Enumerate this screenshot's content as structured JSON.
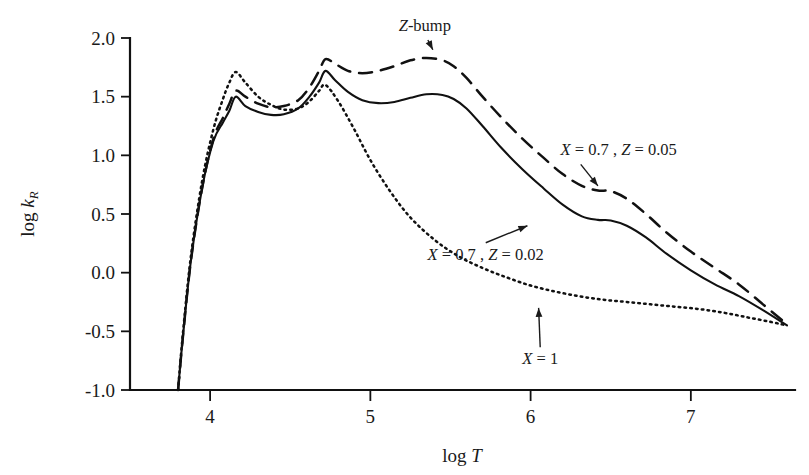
{
  "chart_data": {
    "type": "line",
    "title": "",
    "xlabel": "log T",
    "ylabel": "log k_R",
    "xlabel_parts": {
      "prefix": "log ",
      "symbol": "T"
    },
    "ylabel_parts": {
      "prefix": "log ",
      "symbol": "k",
      "subscript": "R"
    },
    "xlim": [
      3.5,
      7.65
    ],
    "ylim": [
      -1.0,
      2.0
    ],
    "xticks": [
      4,
      5,
      6,
      7
    ],
    "xtick_labels": [
      "4",
      "5",
      "6",
      "7"
    ],
    "yticks": [
      -1.0,
      -0.5,
      0.0,
      0.5,
      1.0,
      1.5,
      2.0
    ],
    "ytick_labels": [
      "-1.0",
      "-0.5",
      "0.0",
      "0.5",
      "1.0",
      "1.5",
      "2.0"
    ],
    "grid": false,
    "legend_position": "inline-annotations",
    "series": [
      {
        "name": "X = 0.7 , Z = 0.02",
        "style": "solid",
        "color": "#111111",
        "x": [
          3.8,
          3.83,
          3.88,
          3.95,
          4.02,
          4.08,
          4.12,
          4.16,
          4.22,
          4.3,
          4.38,
          4.46,
          4.55,
          4.62,
          4.68,
          4.72,
          4.78,
          4.86,
          4.95,
          5.05,
          5.15,
          5.25,
          5.35,
          5.45,
          5.52,
          5.6,
          5.7,
          5.82,
          5.95,
          6.08,
          6.2,
          6.32,
          6.42,
          6.5,
          6.6,
          6.72,
          6.85,
          7.0,
          7.15,
          7.3,
          7.45,
          7.6
        ],
        "y": [
          -1.0,
          -0.55,
          0.1,
          0.72,
          1.12,
          1.28,
          1.38,
          1.5,
          1.42,
          1.37,
          1.345,
          1.35,
          1.4,
          1.5,
          1.62,
          1.72,
          1.64,
          1.54,
          1.47,
          1.445,
          1.455,
          1.49,
          1.52,
          1.515,
          1.48,
          1.4,
          1.25,
          1.06,
          0.88,
          0.72,
          0.58,
          0.48,
          0.45,
          0.445,
          0.4,
          0.3,
          0.16,
          0.02,
          -0.1,
          -0.2,
          -0.32,
          -0.45
        ]
      },
      {
        "name": "X = 0.7 , Z = 0.05",
        "style": "dashed",
        "color": "#111111",
        "x": [
          3.8,
          3.83,
          3.88,
          3.95,
          4.02,
          4.08,
          4.12,
          4.16,
          4.22,
          4.3,
          4.38,
          4.46,
          4.55,
          4.62,
          4.68,
          4.72,
          4.78,
          4.86,
          4.95,
          5.05,
          5.15,
          5.25,
          5.35,
          5.45,
          5.52,
          5.6,
          5.7,
          5.82,
          5.95,
          6.08,
          6.2,
          6.32,
          6.42,
          6.5,
          6.6,
          6.72,
          6.85,
          7.0,
          7.15,
          7.3,
          7.45,
          7.6
        ],
        "y": [
          -1.0,
          -0.55,
          0.1,
          0.72,
          1.14,
          1.32,
          1.44,
          1.55,
          1.5,
          1.44,
          1.41,
          1.42,
          1.47,
          1.58,
          1.72,
          1.82,
          1.78,
          1.72,
          1.7,
          1.72,
          1.76,
          1.81,
          1.83,
          1.81,
          1.76,
          1.66,
          1.5,
          1.32,
          1.14,
          0.98,
          0.84,
          0.74,
          0.7,
          0.695,
          0.63,
          0.5,
          0.34,
          0.18,
          0.04,
          -0.1,
          -0.27,
          -0.44
        ]
      },
      {
        "name": "X = 1",
        "style": "dotted",
        "color": "#111111",
        "x": [
          3.8,
          3.83,
          3.88,
          3.95,
          4.02,
          4.08,
          4.12,
          4.16,
          4.22,
          4.3,
          4.38,
          4.46,
          4.55,
          4.62,
          4.68,
          4.72,
          4.8,
          4.9,
          5.0,
          5.12,
          5.25,
          5.4,
          5.55,
          5.7,
          5.85,
          6.0,
          6.15,
          6.3,
          6.45,
          6.6,
          6.75,
          6.9,
          7.05,
          7.2,
          7.35,
          7.5,
          7.6
        ],
        "y": [
          -1.0,
          -0.52,
          0.14,
          0.78,
          1.22,
          1.48,
          1.62,
          1.71,
          1.62,
          1.5,
          1.43,
          1.39,
          1.4,
          1.46,
          1.55,
          1.6,
          1.46,
          1.22,
          0.96,
          0.7,
          0.47,
          0.28,
          0.14,
          0.04,
          -0.04,
          -0.11,
          -0.16,
          -0.2,
          -0.23,
          -0.25,
          -0.27,
          -0.29,
          -0.31,
          -0.34,
          -0.38,
          -0.42,
          -0.45
        ]
      }
    ],
    "annotations": [
      {
        "id": "z-bump",
        "text": "Z-bump",
        "italic_prefix": "Z",
        "rest": "-bump",
        "arrow": "down",
        "label_x": 5.34,
        "label_y": 2.06,
        "target_x": 5.39,
        "target_y": 1.9
      },
      {
        "id": "series-dashed-label",
        "text": "X = 0.7 , Z = 0.05",
        "arrow": "down-left",
        "label_x": 6.55,
        "label_y": 1.0,
        "target_x": 6.42,
        "target_y": 0.74
      },
      {
        "id": "series-solid-label",
        "text": "X = 0.7 , Z = 0.02",
        "arrow": "up",
        "label_x": 5.72,
        "label_y": 0.11,
        "target_x": 5.98,
        "target_y": 0.4
      },
      {
        "id": "series-dotted-label",
        "text": "X = 1",
        "arrow": "up",
        "label_x": 6.06,
        "label_y": -0.78,
        "target_x": 6.05,
        "target_y": -0.3
      }
    ]
  }
}
